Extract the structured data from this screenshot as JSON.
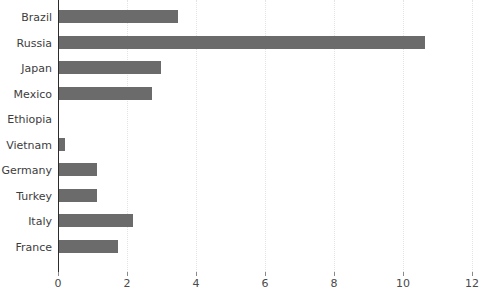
{
  "chart_data": {
    "type": "bar",
    "orientation": "horizontal",
    "title": "",
    "subtitle": "",
    "xlabel": "",
    "ylabel": "",
    "categories": [
      "Brazil",
      "Russia",
      "Japan",
      "Mexico",
      "Ethiopia",
      "Vietnam",
      "Germany",
      "Turkey",
      "Italy",
      "France"
    ],
    "values": [
      3.45,
      10.6,
      2.95,
      2.7,
      0,
      0.17,
      1.1,
      1.1,
      2.15,
      1.7
    ],
    "xlim": [
      0,
      12
    ],
    "xticks": [
      0,
      2,
      4,
      6,
      8,
      10,
      12
    ],
    "xtick_labels": [
      "0",
      "2",
      "4",
      "6",
      "8",
      "10",
      "12"
    ],
    "grid": "vertical-dotted",
    "legend": "none",
    "bar_color": "#6b6b6b",
    "gridline_color": "#e4e4e4",
    "axis_color": "#2c2c2c",
    "background_color": "#ffffff"
  }
}
